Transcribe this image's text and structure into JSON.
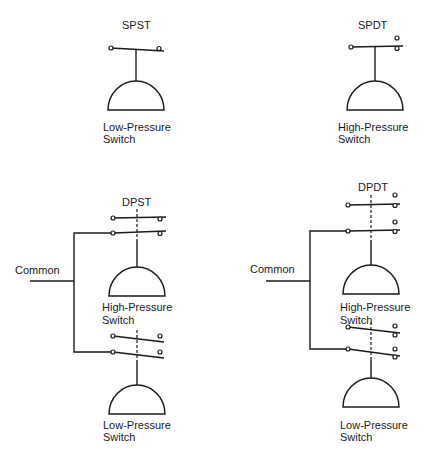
{
  "diagram": {
    "type": "pressure-switch-contact-configurations",
    "panels": [
      {
        "id": "spst",
        "title": "SPST",
        "switches": [
          {
            "label_line1": "Low-Pressure",
            "label_line2": "Switch"
          }
        ]
      },
      {
        "id": "spdt",
        "title": "SPDT",
        "switches": [
          {
            "label_line1": "High-Pressure",
            "label_line2": "Switch"
          }
        ]
      },
      {
        "id": "dpst",
        "title": "DPST",
        "common_label": "Common",
        "switches": [
          {
            "label_line1": "High-Pressure",
            "label_line2": "Switch"
          },
          {
            "label_line1": "Low-Pressure",
            "label_line2": "Switch"
          }
        ]
      },
      {
        "id": "dpdt",
        "title": "DPDT",
        "common_label": "Common",
        "switches": [
          {
            "label_line1": "High-Pressure",
            "label_line2": "Switch"
          },
          {
            "label_line1": "Low-Pressure",
            "label_line2": "Switch"
          }
        ]
      }
    ],
    "colors": {
      "line": "#1a1a1a",
      "background": "#ffffff"
    }
  }
}
